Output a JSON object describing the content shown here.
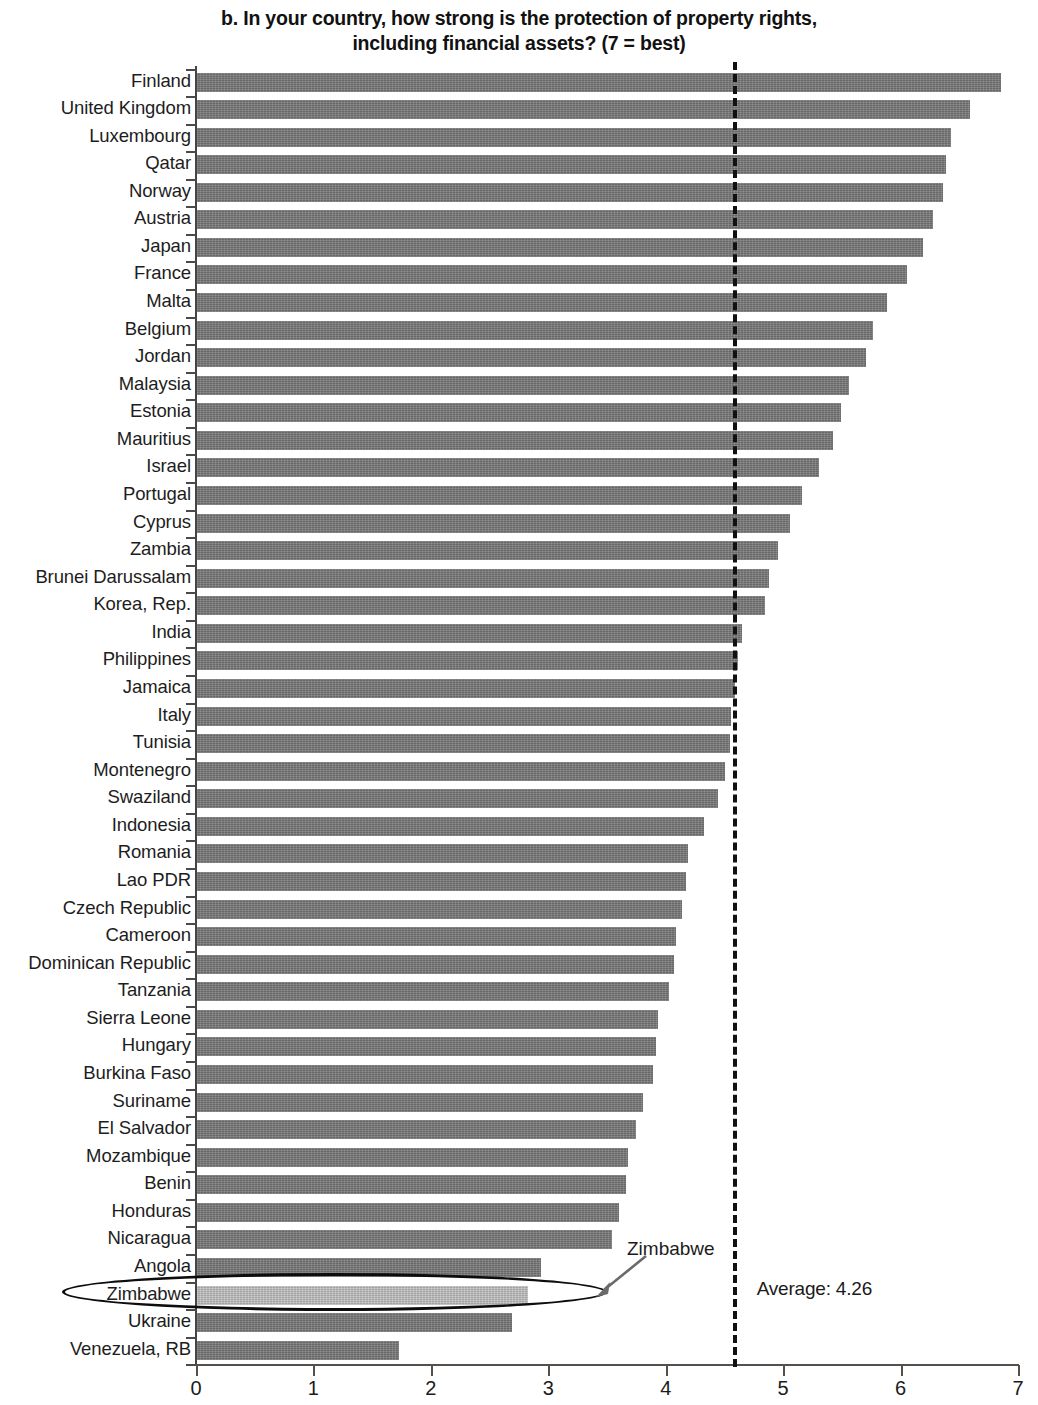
{
  "title": {
    "line1": "b. In your country, how strong is the protection of property rights,",
    "line2": "including financial assets? (7 = best)"
  },
  "annotations": {
    "average_label": "Average: 4.26",
    "callout_label": "Zimbabwe"
  },
  "colors": {
    "bar": "#757575",
    "bar_highlight": "#b3b3b3",
    "axis": "#55504c",
    "text": "#1b1b1b",
    "average_line": "#111111"
  },
  "chart_data": {
    "type": "bar",
    "orientation": "horizontal",
    "title": "b. In your country, how strong is the protection of property rights, including financial assets? (7 = best)",
    "xlabel": "",
    "ylabel": "",
    "xlim": [
      0,
      7
    ],
    "xticks": [
      0,
      1,
      2,
      3,
      4,
      5,
      6,
      7
    ],
    "xtick_labels": [
      "0",
      "1",
      "2",
      "3",
      "4",
      "5",
      "6",
      "7"
    ],
    "grid": false,
    "legend": null,
    "average": 4.26,
    "average_line_value": 4.57,
    "highlight_category": "Zimbabwe",
    "categories": [
      "Finland",
      "United Kingdom",
      "Luxembourg",
      "Qatar",
      "Norway",
      "Austria",
      "Japan",
      "France",
      "Malta",
      "Belgium",
      "Jordan",
      "Malaysia",
      "Estonia",
      "Mauritius",
      "Israel",
      "Portugal",
      "Cyprus",
      "Zambia",
      "Brunei Darussalam",
      "Korea, Rep.",
      "India",
      "Philippines",
      "Jamaica",
      "Italy",
      "Tunisia",
      "Montenegro",
      "Swaziland",
      "Indonesia",
      "Romania",
      "Lao PDR",
      "Czech Republic",
      "Cameroon",
      "Dominican Republic",
      "Tanzania",
      "Sierra Leone",
      "Hungary",
      "Burkina Faso",
      "Suriname",
      "El Salvador",
      "Mozambique",
      "Benin",
      "Honduras",
      "Nicaragua",
      "Angola",
      "Zimbabwe",
      "Ukraine",
      "Venezuela, RB"
    ],
    "values": [
      6.85,
      6.58,
      6.42,
      6.38,
      6.35,
      6.27,
      6.18,
      6.05,
      5.88,
      5.76,
      5.7,
      5.55,
      5.48,
      5.42,
      5.3,
      5.15,
      5.05,
      4.95,
      4.87,
      4.84,
      4.64,
      4.61,
      4.58,
      4.55,
      4.54,
      4.5,
      4.44,
      4.32,
      4.18,
      4.16,
      4.13,
      4.08,
      4.06,
      4.02,
      3.93,
      3.91,
      3.88,
      3.8,
      3.74,
      3.67,
      3.65,
      3.59,
      3.53,
      2.93,
      2.82,
      2.68,
      1.72
    ]
  }
}
